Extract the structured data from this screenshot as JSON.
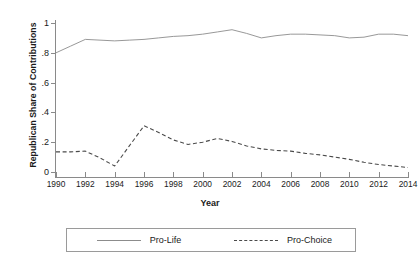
{
  "chart_data": {
    "type": "line",
    "title": "",
    "xlabel": "Year",
    "ylabel": "Republican Share of Contributions",
    "xlim": [
      1990,
      2014
    ],
    "ylim": [
      0,
      1
    ],
    "grid": false,
    "legend_position": "bottom",
    "x_ticks": [
      1990,
      1992,
      1994,
      1996,
      1998,
      2000,
      2002,
      2004,
      2006,
      2008,
      2010,
      2012,
      2014
    ],
    "x_tick_labels": [
      "1990",
      "1992",
      "1994",
      "1996",
      "1998",
      "2000",
      "2002",
      "2004",
      "2006",
      "2008",
      "2010",
      "2012",
      "2014"
    ],
    "y_ticks": [
      0,
      0.2,
      0.4,
      0.6,
      0.8,
      1
    ],
    "y_tick_labels": [
      "0",
      ".2",
      ".4",
      ".6",
      ".8",
      "1"
    ],
    "x": [
      1990,
      1991,
      1992,
      1993,
      1994,
      1995,
      1996,
      1997,
      1998,
      1999,
      2000,
      2001,
      2002,
      2003,
      2004,
      2005,
      2006,
      2007,
      2008,
      2009,
      2010,
      2011,
      2012,
      2013,
      2014
    ],
    "series": [
      {
        "name": "Pro-Life",
        "style": "solid",
        "color": "#8c8c8c",
        "values": [
          0.8,
          0.845,
          0.89,
          0.885,
          0.88,
          0.885,
          0.89,
          0.9,
          0.91,
          0.915,
          0.925,
          0.94,
          0.955,
          0.93,
          0.9,
          0.915,
          0.925,
          0.925,
          0.92,
          0.915,
          0.9,
          0.905,
          0.925,
          0.925,
          0.915
        ]
      },
      {
        "name": "Pro-Choice",
        "style": "dashed",
        "color": "#4a4a4a",
        "values": [
          0.135,
          0.135,
          0.14,
          0.095,
          0.04,
          0.175,
          0.31,
          0.265,
          0.215,
          0.185,
          0.2,
          0.225,
          0.205,
          0.175,
          0.155,
          0.145,
          0.14,
          0.125,
          0.115,
          0.1,
          0.085,
          0.065,
          0.05,
          0.04,
          0.03
        ]
      }
    ]
  },
  "axes": {
    "y_title": "Republican Share of Contributions",
    "x_title": "Year"
  },
  "legend": {
    "items": [
      {
        "label": "Pro-Life",
        "style": "solid"
      },
      {
        "label": "Pro-Choice",
        "style": "dashed"
      }
    ]
  }
}
